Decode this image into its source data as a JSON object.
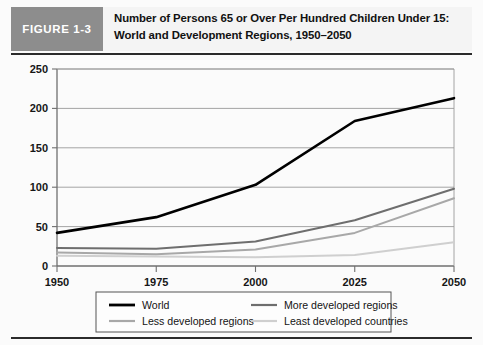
{
  "figure": {
    "badge_label": "FIGURE 1-3",
    "title": "Number of Persons 65 or Over Per Hundred Children Under 15: World and Development Regions, 1950–2050"
  },
  "colors": {
    "badge_background": "#8d8d8d",
    "badge_text": "#ffffff",
    "panel_background": "#fbfbfb",
    "rule": "#2b2b2b",
    "axis": "#6f6f6f",
    "gridline": "#9a9a9a",
    "world": "#000000",
    "more_developed": "#6e6e6e",
    "less_developed": "#a8a8a8",
    "least_developed": "#cfcfcf",
    "legend_border": "#555555"
  },
  "chart_data": {
    "type": "line",
    "title": "Number of Persons 65 or Over Per Hundred Children Under 15: World and Development Regions, 1950–2050",
    "xlabel": "",
    "ylabel": "",
    "x": [
      1950,
      1975,
      2000,
      2025,
      2050
    ],
    "categories": [
      "1950",
      "1975",
      "2000",
      "2025",
      "2050"
    ],
    "xtick_labels": [
      "1950",
      "1975",
      "2000",
      "2025",
      "2050"
    ],
    "ytick_labels": [
      "0",
      "50",
      "100",
      "150",
      "200",
      "250"
    ],
    "yticks": [
      0,
      50,
      100,
      150,
      200,
      250
    ],
    "ylim": [
      0,
      250
    ],
    "xlim": [
      1950,
      2050
    ],
    "grid": "horizontal",
    "legend_position": "bottom",
    "series": [
      {
        "name": "World",
        "color": "#000000",
        "values": [
          42,
          62,
          103,
          184,
          213
        ]
      },
      {
        "name": "More developed regions",
        "color": "#6e6e6e",
        "values": [
          23,
          22,
          31,
          58,
          98
        ]
      },
      {
        "name": "Less developed regions",
        "color": "#a8a8a8",
        "values": [
          17,
          15,
          21,
          42,
          86
        ]
      },
      {
        "name": "Least developed countries",
        "color": "#cfcfcf",
        "values": [
          13,
          12,
          11,
          14,
          30
        ]
      }
    ]
  },
  "legend": {
    "items": [
      {
        "label": "World",
        "color": "#000000"
      },
      {
        "label": "More developed regions",
        "color": "#6e6e6e"
      },
      {
        "label": "Less developed regions",
        "color": "#a8a8a8"
      },
      {
        "label": "Least developed countries",
        "color": "#cfcfcf"
      }
    ]
  }
}
